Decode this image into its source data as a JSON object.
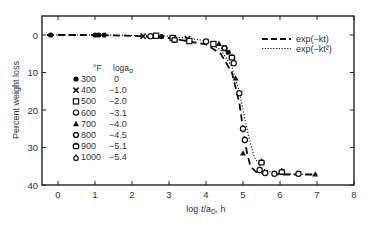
{
  "chart_data": {
    "type": "scatter",
    "title": "",
    "xlabel": "log t/a_D, h",
    "ylabel": "Percent weight loss",
    "xlim": [
      -0.43,
      8
    ],
    "ylim": [
      40,
      -5
    ],
    "y_inverted": true,
    "grid": false,
    "x_ticks": [
      0,
      1,
      2,
      3,
      4,
      5,
      6,
      7,
      8
    ],
    "y_ticks": [
      0,
      10,
      20,
      30,
      40
    ],
    "legend_table": {
      "headers": [
        "°F",
        "log a_D"
      ],
      "rows": [
        {
          "marker": "filled-circle",
          "temp": "300",
          "loga": "0"
        },
        {
          "marker": "x",
          "temp": "400",
          "loga": "−1.0"
        },
        {
          "marker": "square",
          "temp": "500",
          "loga": "−2.0"
        },
        {
          "marker": "open-circle",
          "temp": "600",
          "loga": "−3.1"
        },
        {
          "marker": "triangle",
          "temp": "700",
          "loga": "−4.0"
        },
        {
          "marker": "star-circle",
          "temp": "800",
          "loga": "−4.5"
        },
        {
          "marker": "open-square-flag",
          "temp": "900",
          "loga": "−5.1"
        },
        {
          "marker": "open-triangle",
          "temp": "1000",
          "loga": "−5.4"
        }
      ]
    },
    "curve_legend": [
      {
        "style": "dashed",
        "label": "exp(−kt)"
      },
      {
        "style": "dotted",
        "label": "exp(−kt²)"
      }
    ],
    "series": [
      {
        "name": "exp(-kt)",
        "style": "dashed",
        "x": [
          -0.3,
          1,
          2,
          3,
          4,
          4.4,
          4.7,
          4.9,
          5.0,
          5.1,
          5.2,
          5.35,
          5.6,
          6,
          7
        ],
        "y": [
          0,
          0,
          0.2,
          0.8,
          2.5,
          5,
          10,
          18,
          25,
          31,
          35,
          36.5,
          37,
          37.2,
          37.2
        ]
      },
      {
        "name": "exp(-kt^2)",
        "style": "dotted",
        "x": [
          -0.3,
          1,
          2,
          3,
          4,
          4.4,
          4.7,
          4.9,
          5.0,
          5.15,
          5.3,
          5.5,
          5.8,
          6.2,
          7
        ],
        "y": [
          0,
          0,
          0.1,
          0.3,
          1.5,
          4,
          8.5,
          15,
          20,
          27,
          32.5,
          35.5,
          36.8,
          37.1,
          37.2
        ]
      },
      {
        "name": "data",
        "style": "points",
        "points": [
          [
            -0.2,
            0,
            "filled-circle"
          ],
          [
            1.0,
            0,
            "filled-circle"
          ],
          [
            1.1,
            0,
            "filled-circle"
          ],
          [
            1.25,
            0,
            "filled-circle"
          ],
          [
            2.3,
            0.3,
            "x"
          ],
          [
            2.5,
            0.3,
            "open-circle"
          ],
          [
            2.65,
            0.2,
            "square"
          ],
          [
            2.8,
            0.4,
            "filled-circle"
          ],
          [
            3.1,
            0.8,
            "square"
          ],
          [
            3.15,
            1.3,
            "open-square-flag"
          ],
          [
            3.5,
            1,
            "x"
          ],
          [
            3.55,
            1.6,
            "square"
          ],
          [
            4.0,
            1.7,
            "open-circle"
          ],
          [
            4.2,
            2.4,
            "square"
          ],
          [
            4.35,
            2.3,
            "triangle"
          ],
          [
            4.5,
            3.5,
            "star-circle"
          ],
          [
            4.6,
            4.6,
            "filled-circle"
          ],
          [
            4.7,
            6,
            "open-square-flag"
          ],
          [
            4.75,
            7.5,
            "open-circle"
          ],
          [
            4.8,
            11.5,
            "triangle"
          ],
          [
            4.9,
            15.5,
            "open-circle"
          ],
          [
            5.0,
            25,
            "open-circle"
          ],
          [
            5.05,
            28,
            "open-circle"
          ],
          [
            5.0,
            31.5,
            "triangle"
          ],
          [
            5.5,
            34,
            "open-square-flag"
          ],
          [
            5.45,
            36,
            "open-circle"
          ],
          [
            5.6,
            36.8,
            "open-circle"
          ],
          [
            5.85,
            37,
            "open-circle"
          ],
          [
            6.05,
            36.5,
            "open-square-flag"
          ],
          [
            6.5,
            37,
            "open-circle"
          ],
          [
            6.95,
            37.1,
            "triangle"
          ]
        ]
      }
    ]
  }
}
